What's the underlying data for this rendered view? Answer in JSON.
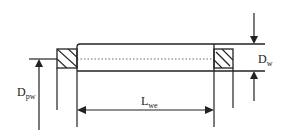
{
  "diagram": {
    "labels": {
      "pitch_diameter": {
        "main": "D",
        "sub": "pw"
      },
      "roller_diameter": {
        "main": "D",
        "sub": "w"
      },
      "effective_length": {
        "main": "L",
        "sub": "we"
      }
    },
    "colors": {
      "line": "#222222",
      "background": "#ffffff"
    }
  }
}
